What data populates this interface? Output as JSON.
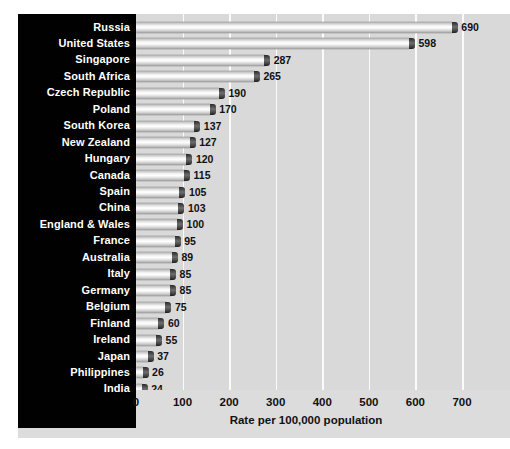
{
  "chart_data": {
    "type": "bar",
    "orientation": "horizontal",
    "title": "",
    "xlabel": "Rate per 100,000 population",
    "ylabel": "",
    "xlim": [
      0,
      700
    ],
    "xticks": [
      0,
      100,
      200,
      300,
      400,
      500,
      600,
      700
    ],
    "xtick_labels": [
      "0",
      "100",
      "200",
      "300",
      "400",
      "500",
      "600",
      "700"
    ],
    "grid": "vertical",
    "legend": "none",
    "categories": [
      "Russia",
      "United States",
      "Singapore",
      "South Africa",
      "Czech Republic",
      "Poland",
      "South Korea",
      "New Zealand",
      "Hungary",
      "Canada",
      "Spain",
      "China",
      "England & Wales",
      "France",
      "Australia",
      "Italy",
      "Germany",
      "Belgium",
      "Finland",
      "Ireland",
      "Japan",
      "Philippines",
      "India"
    ],
    "values": [
      690,
      598,
      287,
      265,
      190,
      170,
      137,
      127,
      120,
      115,
      105,
      103,
      100,
      95,
      89,
      85,
      85,
      75,
      60,
      55,
      37,
      26,
      24
    ],
    "value_labels": [
      "690",
      "598",
      "287",
      "265",
      "190",
      "170",
      "137",
      "127",
      "120",
      "115",
      "105",
      "103",
      "100",
      "95",
      "89",
      "85",
      "85",
      "75",
      "60",
      "55",
      "37",
      "26",
      "24"
    ]
  },
  "style": {
    "panel_background": "#010101",
    "panel_text_color": "#ffffff",
    "plot_background": "#d9d9d9",
    "gridline_color": "#fbfbfb",
    "bar_cap_color": "#2a2a2a",
    "value_text_color": "#111111"
  }
}
